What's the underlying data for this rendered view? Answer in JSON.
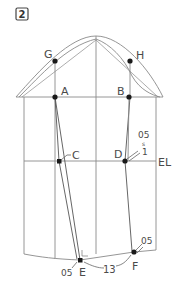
{
  "step": {
    "number": "2"
  },
  "labels": {
    "G": "G",
    "H": "H",
    "A": "A",
    "B": "B",
    "C": "C",
    "D": "D",
    "E": "E",
    "F": "F",
    "EL": "EL"
  },
  "measurements": {
    "d_offset_top": "05",
    "d_offset_sep": "s",
    "d_offset_bottom": "1",
    "f_offset": "05",
    "e_offset": "05",
    "ef_length": "13"
  },
  "colors": {
    "line": "#8a8a8a",
    "dark_line": "#555555",
    "point": "#1a1a1a"
  }
}
